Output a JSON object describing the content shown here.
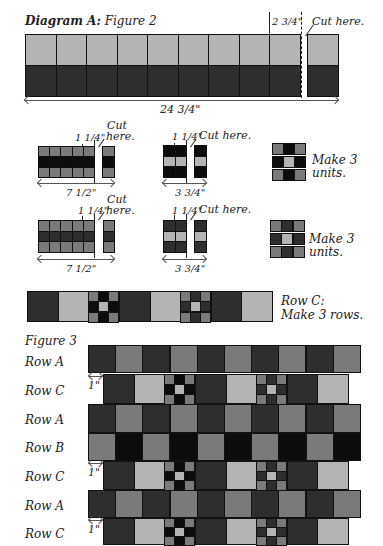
{
  "colors": {
    "light": "#b4b4b4",
    "medium": "#7a7a7a",
    "dark": "#2e2e2e",
    "black": "#0c0c0c",
    "outline": "#111111"
  },
  "diagram_a": {
    "title_bold": "Diagram A:",
    "title_italic": "Figure 2",
    "strip_dim": "2 3/4\"",
    "strip_cut": "Cut here.",
    "strip_length": "24 3/4\""
  },
  "unit_row1": {
    "left_cut_width": "1 1/4\"",
    "left_cut_label_line1": "Cut",
    "left_cut_label_line2": "here.",
    "left_length": "7 1/2\"",
    "mid_cut_width": "1 1/4\"",
    "mid_cut_label": "Cut here.",
    "mid_length": "3 3/4\"",
    "make_line1": "Make 3",
    "make_line2": "units."
  },
  "unit_row2": {
    "left_cut_width": "1 1/4\"",
    "left_cut_label_line1": "Cut",
    "left_cut_label_line2": "here.",
    "left_length": "7 1/2\"",
    "mid_cut_width": "1 1/4\"",
    "mid_cut_label": "Cut here.",
    "mid_length": "3 3/4\"",
    "make_line1": "Make 3",
    "make_line2": "units."
  },
  "row_c_strip": {
    "label_line1": "Row C:",
    "label_line2": "Make 3 rows."
  },
  "figure3": {
    "title": "Figure 3",
    "rows": [
      {
        "label": "Row A",
        "offset": ""
      },
      {
        "label": "Row C",
        "offset": "1\""
      },
      {
        "label": "Row A",
        "offset": ""
      },
      {
        "label": "Row B",
        "offset": ""
      },
      {
        "label": "Row C",
        "offset": "1\""
      },
      {
        "label": "Row A",
        "offset": ""
      },
      {
        "label": "Row C",
        "offset": "1\""
      }
    ]
  }
}
